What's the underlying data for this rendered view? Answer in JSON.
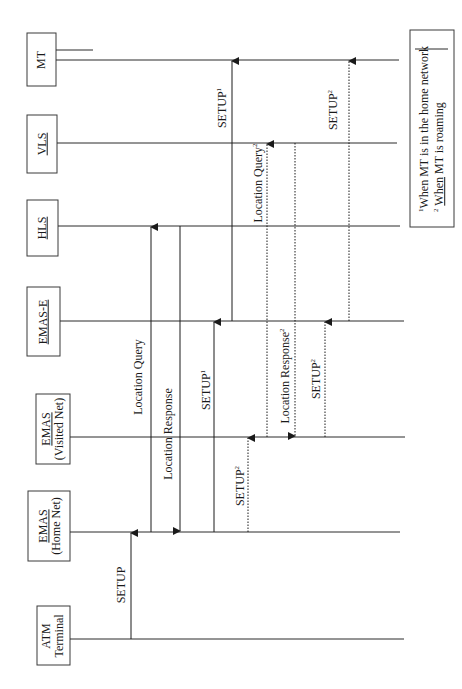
{
  "diagram": {
    "type": "sequence-diagram",
    "orientation": "rotated-90-ccw",
    "colors": {
      "line": "#2a2a2a",
      "box_border": "#3a3a3a",
      "background": "#ffffff"
    }
  },
  "actors": [
    {
      "id": "mt",
      "line1": "MT",
      "line2": "",
      "underlined": false,
      "lifeline_y": 60
    },
    {
      "id": "vls",
      "line1": "VLS",
      "line2": "",
      "underlined": true,
      "lifeline_y": 143
    },
    {
      "id": "hls",
      "line1": "HLS",
      "line2": "",
      "underlined": true,
      "lifeline_y": 226
    },
    {
      "id": "emas-e",
      "line1": "EMAS-E",
      "line2": "",
      "underlined": true,
      "lifeline_y": 321
    },
    {
      "id": "emas-visited",
      "line1": "EMAS",
      "line2": "(Visited Net)",
      "underlined": true,
      "lifeline_y": 437
    },
    {
      "id": "emas-home",
      "line1": "EMAS",
      "line2": "(Home Net)",
      "underlined": true,
      "lifeline_y": 532
    },
    {
      "id": "atm-terminal",
      "line1": "ATM",
      "line2": "Terminal",
      "underlined": false,
      "lifeline_y": 639
    }
  ],
  "messages": [
    {
      "label": "SETUP",
      "sup": "",
      "from": "ATM Terminal",
      "to": "EMAS (Home Net)",
      "style": "solid"
    },
    {
      "label": "Location Query",
      "sup": "",
      "from": "EMAS (Home Net)",
      "to": "HLS",
      "style": "solid"
    },
    {
      "label": "Location Response",
      "sup": "",
      "from": "HLS",
      "to": "EMAS (Home Net)",
      "style": "solid"
    },
    {
      "label": "SETUP",
      "sup": "1",
      "from": "EMAS (Home Net)",
      "to": "EMAS-E",
      "style": "solid"
    },
    {
      "label": "SETUP",
      "sup": "2",
      "from": "EMAS (Home Net)",
      "to": "EMAS (Visited Net)",
      "style": "dotted"
    },
    {
      "label": "SETUP",
      "sup": "1",
      "from": "EMAS-E",
      "to": "MT",
      "style": "solid"
    },
    {
      "label": "Location Query",
      "sup": "2",
      "from": "EMAS (Visited Net)",
      "to": "VLS",
      "style": "dotted"
    },
    {
      "label": "Location Response",
      "sup": "2",
      "from": "VLS",
      "to": "EMAS (Visited Net)",
      "style": "dotted"
    },
    {
      "label": "SETUP",
      "sup": "2",
      "from": "EMAS (Visited Net)",
      "to": "EMAS-E",
      "style": "dotted"
    },
    {
      "label": "SETUP",
      "sup": "2",
      "from": "EMAS-E",
      "to": "MT",
      "style": "dotted"
    }
  ],
  "legend": {
    "note1_sup": "1",
    "note1": "When MT is in the home network",
    "note2_sup": "2",
    "note2_when": "When",
    "note2_rest": " MT is roaming"
  }
}
